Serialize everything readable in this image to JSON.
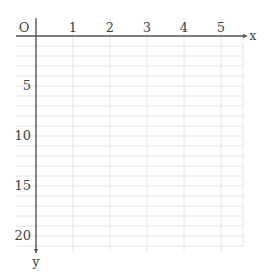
{
  "chart_data": {
    "type": "line",
    "title": "",
    "xlabel": "x",
    "ylabel": "y",
    "origin_label": "O",
    "x_ticks": [
      1,
      2,
      3,
      4,
      5
    ],
    "y_ticks": [
      5,
      10,
      15,
      20
    ],
    "xlim": [
      0,
      5.5
    ],
    "ylim": [
      0,
      21
    ],
    "y_direction": "down",
    "grid": true,
    "minor_grid_y_step": 1,
    "series": []
  },
  "colors": {
    "axis": "#555555",
    "grid": "#dddddd",
    "text": "#444444"
  }
}
